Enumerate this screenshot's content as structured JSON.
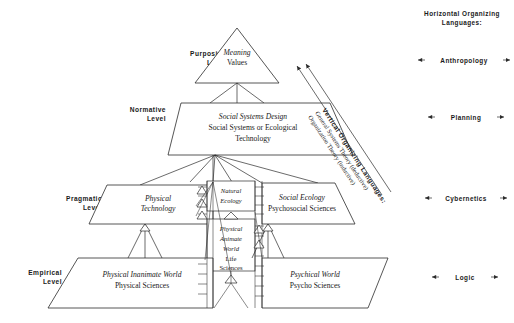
{
  "figure": {
    "title_right_column": "Horizontal Organizing Languages:",
    "levels": [
      {
        "id": "purposive",
        "line1": "Purposive",
        "line2": "Level"
      },
      {
        "id": "normative",
        "line1": "Normative",
        "line2": "Level"
      },
      {
        "id": "pragmatic",
        "line1": "Pragmatic",
        "line2": "Level"
      },
      {
        "id": "empirical",
        "line1": "Empirical",
        "line2": "Level"
      }
    ],
    "horizontal_languages": [
      {
        "id": "anthropology",
        "label": "Anthropology"
      },
      {
        "id": "planning",
        "label": "Planning"
      },
      {
        "id": "cybernetics",
        "label": "Cybernetics"
      },
      {
        "id": "logic",
        "label": "Logic"
      }
    ],
    "vertical_language": {
      "title": "Vertical Organizing Languages:",
      "line1": "General Systems Theory (deductive)",
      "line2": "Organization Theory (inductive)"
    },
    "nodes": {
      "apex": {
        "line1": "Meaning",
        "line2": "Values"
      },
      "normative": {
        "line1": "Social Systems Design",
        "line2": "Social Systems or Ecological",
        "line3": "Technology"
      },
      "physical_technology": {
        "line1": "Physical",
        "line2": "Technology"
      },
      "natural_ecology": {
        "line1": "Natural",
        "line2": "Ecology"
      },
      "social_ecology": {
        "line1": "Social Ecology",
        "line2": "Psychosocial Sciences"
      },
      "physical_animate": {
        "line1": "Physical",
        "line2": "Animate",
        "line3": "World",
        "line4": "Life",
        "line5": "Sciences"
      },
      "physical_inanimate": {
        "line1": "Physical Inanimate World",
        "line2": "Physical Sciences"
      },
      "psychical": {
        "line1": "Psychical World",
        "line2": "Psycho Sciences"
      }
    },
    "colors": {
      "ink": "#1a1a1a",
      "stroke": "#2b2b2b",
      "paper": "#ffffff"
    }
  }
}
